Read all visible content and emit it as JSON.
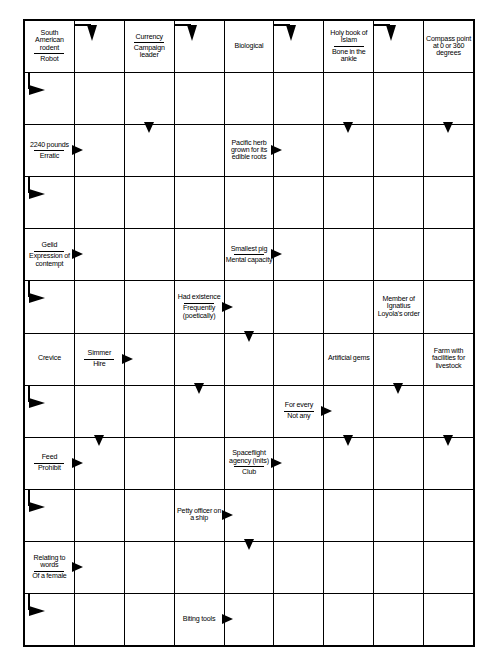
{
  "puzzle": {
    "type": "arrow-word crossword (Schwedenrätsel)",
    "columns": 9,
    "rows": 12,
    "ink_color": "#000000",
    "background_color": "#ffffff"
  },
  "cells": [
    {
      "r": 0,
      "c": 0,
      "kind": "clue",
      "lines": [
        "South American rodent",
        "Robot"
      ],
      "arrows": []
    },
    {
      "r": 0,
      "c": 1,
      "kind": "empty",
      "arrows": [
        "bend-rd"
      ]
    },
    {
      "r": 0,
      "c": 2,
      "kind": "clue",
      "lines": [
        "Currency",
        "Campaign leader"
      ],
      "arrows": []
    },
    {
      "r": 0,
      "c": 3,
      "kind": "empty",
      "arrows": [
        "bend-rd"
      ]
    },
    {
      "r": 0,
      "c": 4,
      "kind": "clue",
      "lines": [
        "Biological"
      ],
      "arrows": []
    },
    {
      "r": 0,
      "c": 5,
      "kind": "empty",
      "arrows": [
        "bend-rd"
      ]
    },
    {
      "r": 0,
      "c": 6,
      "kind": "clue",
      "lines": [
        "Holy book of Islam",
        "Bone in the ankle"
      ],
      "arrows": []
    },
    {
      "r": 0,
      "c": 7,
      "kind": "empty",
      "arrows": [
        "bend-rd"
      ]
    },
    {
      "r": 0,
      "c": 8,
      "kind": "clue",
      "lines": [
        "Compass point at 0 or 360 degrees"
      ],
      "arrows": []
    },
    {
      "r": 1,
      "c": 0,
      "kind": "empty",
      "arrows": [
        "bend-dr"
      ]
    },
    {
      "r": 1,
      "c": 1,
      "kind": "empty",
      "arrows": []
    },
    {
      "r": 1,
      "c": 2,
      "kind": "empty",
      "arrows": [
        "down-in"
      ]
    },
    {
      "r": 1,
      "c": 3,
      "kind": "empty",
      "arrows": []
    },
    {
      "r": 1,
      "c": 4,
      "kind": "empty",
      "arrows": []
    },
    {
      "r": 1,
      "c": 5,
      "kind": "empty",
      "arrows": []
    },
    {
      "r": 1,
      "c": 6,
      "kind": "empty",
      "arrows": [
        "down-in"
      ]
    },
    {
      "r": 1,
      "c": 7,
      "kind": "empty",
      "arrows": []
    },
    {
      "r": 1,
      "c": 8,
      "kind": "empty",
      "arrows": [
        "down-in"
      ]
    },
    {
      "r": 2,
      "c": 0,
      "kind": "clue",
      "lines": [
        "2240 pounds",
        "Erratic"
      ],
      "arrows": [
        "right"
      ]
    },
    {
      "r": 2,
      "c": 1,
      "kind": "empty",
      "arrows": []
    },
    {
      "r": 2,
      "c": 2,
      "kind": "empty",
      "arrows": []
    },
    {
      "r": 2,
      "c": 3,
      "kind": "empty",
      "arrows": []
    },
    {
      "r": 2,
      "c": 4,
      "kind": "clue",
      "lines": [
        "Pacific herb grown for its edible roots"
      ],
      "arrows": [
        "right"
      ]
    },
    {
      "r": 2,
      "c": 5,
      "kind": "empty",
      "arrows": []
    },
    {
      "r": 2,
      "c": 6,
      "kind": "empty",
      "arrows": []
    },
    {
      "r": 2,
      "c": 7,
      "kind": "empty",
      "arrows": []
    },
    {
      "r": 2,
      "c": 8,
      "kind": "empty",
      "arrows": []
    },
    {
      "r": 3,
      "c": 0,
      "kind": "empty",
      "arrows": [
        "bend-dr"
      ]
    },
    {
      "r": 3,
      "c": 1,
      "kind": "empty",
      "arrows": []
    },
    {
      "r": 3,
      "c": 2,
      "kind": "empty",
      "arrows": []
    },
    {
      "r": 3,
      "c": 3,
      "kind": "empty",
      "arrows": []
    },
    {
      "r": 3,
      "c": 4,
      "kind": "empty",
      "arrows": []
    },
    {
      "r": 3,
      "c": 5,
      "kind": "empty",
      "arrows": []
    },
    {
      "r": 3,
      "c": 6,
      "kind": "empty",
      "arrows": []
    },
    {
      "r": 3,
      "c": 7,
      "kind": "empty",
      "arrows": []
    },
    {
      "r": 3,
      "c": 8,
      "kind": "empty",
      "arrows": []
    },
    {
      "r": 4,
      "c": 0,
      "kind": "clue",
      "lines": [
        "Gelid",
        "Expression of contempt"
      ],
      "arrows": [
        "right"
      ]
    },
    {
      "r": 4,
      "c": 1,
      "kind": "empty",
      "arrows": []
    },
    {
      "r": 4,
      "c": 2,
      "kind": "empty",
      "arrows": []
    },
    {
      "r": 4,
      "c": 3,
      "kind": "empty",
      "arrows": []
    },
    {
      "r": 4,
      "c": 4,
      "kind": "clue",
      "lines": [
        "Smallest pig",
        "Mental capacity"
      ],
      "arrows": [
        "right"
      ]
    },
    {
      "r": 4,
      "c": 5,
      "kind": "empty",
      "arrows": []
    },
    {
      "r": 4,
      "c": 6,
      "kind": "empty",
      "arrows": []
    },
    {
      "r": 4,
      "c": 7,
      "kind": "empty",
      "arrows": []
    },
    {
      "r": 4,
      "c": 8,
      "kind": "empty",
      "arrows": []
    },
    {
      "r": 5,
      "c": 0,
      "kind": "empty",
      "arrows": [
        "bend-dr"
      ]
    },
    {
      "r": 5,
      "c": 1,
      "kind": "empty",
      "arrows": []
    },
    {
      "r": 5,
      "c": 2,
      "kind": "empty",
      "arrows": []
    },
    {
      "r": 5,
      "c": 3,
      "kind": "clue",
      "lines": [
        "Had existence",
        "Frequently (poetically)"
      ],
      "arrows": [
        "right"
      ]
    },
    {
      "r": 5,
      "c": 4,
      "kind": "empty",
      "arrows": [
        "down-in"
      ]
    },
    {
      "r": 5,
      "c": 5,
      "kind": "empty",
      "arrows": []
    },
    {
      "r": 5,
      "c": 6,
      "kind": "empty",
      "arrows": []
    },
    {
      "r": 5,
      "c": 7,
      "kind": "clue",
      "lines": [
        "Member of Ignatius Loyola's order"
      ],
      "arrows": []
    },
    {
      "r": 5,
      "c": 8,
      "kind": "empty",
      "arrows": []
    },
    {
      "r": 6,
      "c": 0,
      "kind": "clue",
      "lines": [
        "Crevice"
      ],
      "arrows": []
    },
    {
      "r": 6,
      "c": 1,
      "kind": "clue",
      "lines": [
        "Simmer",
        "Hire"
      ],
      "arrows": [
        "right"
      ]
    },
    {
      "r": 6,
      "c": 2,
      "kind": "empty",
      "arrows": []
    },
    {
      "r": 6,
      "c": 3,
      "kind": "empty",
      "arrows": [
        "down-in"
      ]
    },
    {
      "r": 6,
      "c": 4,
      "kind": "empty",
      "arrows": []
    },
    {
      "r": 6,
      "c": 5,
      "kind": "empty",
      "arrows": []
    },
    {
      "r": 6,
      "c": 6,
      "kind": "clue",
      "lines": [
        "Artificial gems"
      ],
      "arrows": []
    },
    {
      "r": 6,
      "c": 7,
      "kind": "empty",
      "arrows": [
        "down-in"
      ]
    },
    {
      "r": 6,
      "c": 8,
      "kind": "clue",
      "lines": [
        "Farm with facilities for livestock"
      ],
      "arrows": []
    },
    {
      "r": 7,
      "c": 0,
      "kind": "empty",
      "arrows": [
        "bend-dr"
      ]
    },
    {
      "r": 7,
      "c": 1,
      "kind": "empty",
      "arrows": [
        "down-in"
      ]
    },
    {
      "r": 7,
      "c": 2,
      "kind": "empty",
      "arrows": []
    },
    {
      "r": 7,
      "c": 3,
      "kind": "empty",
      "arrows": []
    },
    {
      "r": 7,
      "c": 4,
      "kind": "empty",
      "arrows": []
    },
    {
      "r": 7,
      "c": 5,
      "kind": "clue",
      "lines": [
        "For every",
        "Not any"
      ],
      "arrows": [
        "right"
      ]
    },
    {
      "r": 7,
      "c": 6,
      "kind": "empty",
      "arrows": [
        "down-in"
      ]
    },
    {
      "r": 7,
      "c": 7,
      "kind": "empty",
      "arrows": []
    },
    {
      "r": 7,
      "c": 8,
      "kind": "empty",
      "arrows": [
        "down-in"
      ]
    },
    {
      "r": 8,
      "c": 0,
      "kind": "clue",
      "lines": [
        "Feed",
        "Prohibit"
      ],
      "arrows": [
        "right"
      ]
    },
    {
      "r": 8,
      "c": 1,
      "kind": "empty",
      "arrows": []
    },
    {
      "r": 8,
      "c": 2,
      "kind": "empty",
      "arrows": []
    },
    {
      "r": 8,
      "c": 3,
      "kind": "empty",
      "arrows": []
    },
    {
      "r": 8,
      "c": 4,
      "kind": "clue",
      "lines": [
        "Spaceflight agency (inits)",
        "Club"
      ],
      "arrows": [
        "right"
      ]
    },
    {
      "r": 8,
      "c": 5,
      "kind": "empty",
      "arrows": []
    },
    {
      "r": 8,
      "c": 6,
      "kind": "empty",
      "arrows": []
    },
    {
      "r": 8,
      "c": 7,
      "kind": "empty",
      "arrows": []
    },
    {
      "r": 8,
      "c": 8,
      "kind": "empty",
      "arrows": []
    },
    {
      "r": 9,
      "c": 0,
      "kind": "empty",
      "arrows": [
        "bend-dr"
      ]
    },
    {
      "r": 9,
      "c": 1,
      "kind": "empty",
      "arrows": []
    },
    {
      "r": 9,
      "c": 2,
      "kind": "empty",
      "arrows": []
    },
    {
      "r": 9,
      "c": 3,
      "kind": "clue",
      "lines": [
        "Petty officer on a ship"
      ],
      "arrows": [
        "right"
      ]
    },
    {
      "r": 9,
      "c": 4,
      "kind": "empty",
      "arrows": [
        "down-in"
      ]
    },
    {
      "r": 9,
      "c": 5,
      "kind": "empty",
      "arrows": []
    },
    {
      "r": 9,
      "c": 6,
      "kind": "empty",
      "arrows": []
    },
    {
      "r": 9,
      "c": 7,
      "kind": "empty",
      "arrows": []
    },
    {
      "r": 9,
      "c": 8,
      "kind": "empty",
      "arrows": []
    },
    {
      "r": 10,
      "c": 0,
      "kind": "clue",
      "lines": [
        "Relating to words",
        "Of a female"
      ],
      "arrows": [
        "right"
      ]
    },
    {
      "r": 10,
      "c": 1,
      "kind": "empty",
      "arrows": []
    },
    {
      "r": 10,
      "c": 2,
      "kind": "empty",
      "arrows": []
    },
    {
      "r": 10,
      "c": 3,
      "kind": "empty",
      "arrows": []
    },
    {
      "r": 10,
      "c": 4,
      "kind": "empty",
      "arrows": []
    },
    {
      "r": 10,
      "c": 5,
      "kind": "empty",
      "arrows": []
    },
    {
      "r": 10,
      "c": 6,
      "kind": "empty",
      "arrows": []
    },
    {
      "r": 10,
      "c": 7,
      "kind": "empty",
      "arrows": []
    },
    {
      "r": 10,
      "c": 8,
      "kind": "empty",
      "arrows": []
    },
    {
      "r": 11,
      "c": 0,
      "kind": "empty",
      "arrows": [
        "bend-dr"
      ]
    },
    {
      "r": 11,
      "c": 1,
      "kind": "empty",
      "arrows": []
    },
    {
      "r": 11,
      "c": 2,
      "kind": "empty",
      "arrows": []
    },
    {
      "r": 11,
      "c": 3,
      "kind": "clue",
      "lines": [
        "Biting tools"
      ],
      "arrows": [
        "right"
      ]
    },
    {
      "r": 11,
      "c": 4,
      "kind": "empty",
      "arrows": []
    },
    {
      "r": 11,
      "c": 5,
      "kind": "empty",
      "arrows": []
    },
    {
      "r": 11,
      "c": 6,
      "kind": "empty",
      "arrows": []
    },
    {
      "r": 11,
      "c": 7,
      "kind": "empty",
      "arrows": []
    },
    {
      "r": 11,
      "c": 8,
      "kind": "empty",
      "arrows": []
    }
  ]
}
